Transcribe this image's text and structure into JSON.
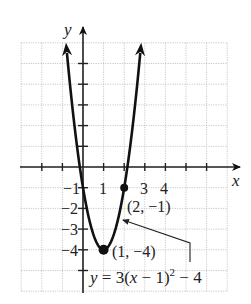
{
  "chart_data": {
    "type": "line",
    "title": "",
    "equation": "y = 3(x − 1)² − 4",
    "equation_parts": {
      "prefix": "y",
      "mid": " = 3(",
      "x": "x",
      "after_x": " − 1)",
      "exp": "2",
      "suffix": " − 4"
    },
    "xlabel": "x",
    "ylabel": "y",
    "xlim": [
      -3,
      7
    ],
    "ylim": [
      -6,
      6
    ],
    "grid": true,
    "x_tick_labels": [
      {
        "value": -1,
        "text": "−1"
      },
      {
        "value": 1,
        "text": "1"
      },
      {
        "value": 3,
        "text": "3"
      },
      {
        "value": 4,
        "text": "4"
      }
    ],
    "y_tick_labels": [
      {
        "value": -1,
        "text": "−1"
      },
      {
        "value": -2,
        "text": "−2"
      },
      {
        "value": -3,
        "text": "−3"
      },
      {
        "value": -4,
        "text": "−4"
      }
    ],
    "series": [
      {
        "name": "y = 3(x − 1)² − 4",
        "x": [
          -0.826,
          -0.5,
          0,
          0.5,
          1,
          1.5,
          2,
          2.5,
          2.826
        ],
        "y": [
          6,
          2.75,
          -1,
          -3.25,
          -4,
          -3.25,
          -1,
          2.75,
          6
        ]
      }
    ],
    "points": [
      {
        "x": 2,
        "y": -1,
        "label": "(2, −1)"
      },
      {
        "x": 1,
        "y": -4,
        "label": "(1, −4)"
      }
    ],
    "color": "#111111",
    "grid_color": "#bbbbbb"
  }
}
